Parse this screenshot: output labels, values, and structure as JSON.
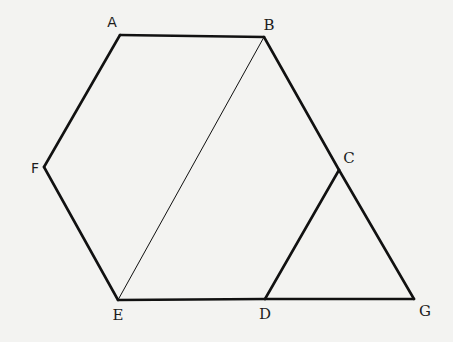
{
  "diagram": {
    "type": "geometry",
    "colors": {
      "stroke": "#111111",
      "background": "#f3f3f1",
      "label": "#1c1c1c"
    },
    "points": {
      "A": {
        "label": "A",
        "x": 120,
        "y": 35,
        "lx": 112,
        "ly": 22
      },
      "B": {
        "label": "B",
        "x": 264,
        "y": 37,
        "lx": 269,
        "ly": 25
      },
      "C": {
        "label": "C",
        "x": 339,
        "y": 170,
        "lx": 349,
        "ly": 158
      },
      "D": {
        "label": "D",
        "x": 265,
        "y": 299,
        "lx": 265,
        "ly": 314
      },
      "E": {
        "label": "E",
        "x": 118,
        "y": 300,
        "lx": 118,
        "ly": 315
      },
      "F": {
        "label": "F",
        "x": 44,
        "y": 167,
        "lx": 35,
        "ly": 168
      },
      "G": {
        "label": "G",
        "x": 414,
        "y": 299,
        "lx": 425,
        "ly": 311
      }
    },
    "segments": [
      {
        "from": "A",
        "to": "B",
        "weight": "thick"
      },
      {
        "from": "B",
        "to": "C",
        "weight": "thick"
      },
      {
        "from": "C",
        "to": "D",
        "weight": "thick"
      },
      {
        "from": "D",
        "to": "E",
        "weight": "thick"
      },
      {
        "from": "E",
        "to": "F",
        "weight": "thick"
      },
      {
        "from": "F",
        "to": "A",
        "weight": "thick"
      },
      {
        "from": "C",
        "to": "G",
        "weight": "thick"
      },
      {
        "from": "D",
        "to": "G",
        "weight": "thick"
      },
      {
        "from": "B",
        "to": "E",
        "weight": "thin"
      }
    ]
  }
}
